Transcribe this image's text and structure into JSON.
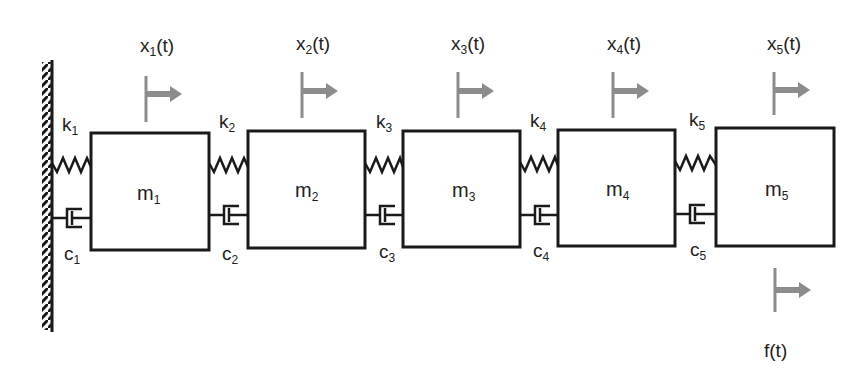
{
  "diagram": {
    "type": "mass-spring-damper chain",
    "colors": {
      "line": "#1a1a1a",
      "arrow": "#8c8c8c",
      "text": "#222222",
      "background": "#ffffff"
    },
    "wall": {
      "label": "fixed-wall"
    },
    "masses": [
      {
        "name": "m",
        "sub": "1"
      },
      {
        "name": "m",
        "sub": "2"
      },
      {
        "name": "m",
        "sub": "3"
      },
      {
        "name": "m",
        "sub": "4"
      },
      {
        "name": "m",
        "sub": "5"
      }
    ],
    "springs": [
      {
        "name": "k",
        "sub": "1"
      },
      {
        "name": "k",
        "sub": "2"
      },
      {
        "name": "k",
        "sub": "3"
      },
      {
        "name": "k",
        "sub": "4"
      },
      {
        "name": "k",
        "sub": "5"
      }
    ],
    "dampers": [
      {
        "name": "c",
        "sub": "1"
      },
      {
        "name": "c",
        "sub": "2"
      },
      {
        "name": "c",
        "sub": "3"
      },
      {
        "name": "c",
        "sub": "4"
      },
      {
        "name": "c",
        "sub": "5"
      }
    ],
    "displacements": [
      {
        "name": "x",
        "sub": "1",
        "arg": "(t)"
      },
      {
        "name": "x",
        "sub": "2",
        "arg": "(t)"
      },
      {
        "name": "x",
        "sub": "3",
        "arg": "(t)"
      },
      {
        "name": "x",
        "sub": "4",
        "arg": "(t)"
      },
      {
        "name": "x",
        "sub": "5",
        "arg": "(t)"
      }
    ],
    "force": {
      "label": "f(t)"
    }
  }
}
